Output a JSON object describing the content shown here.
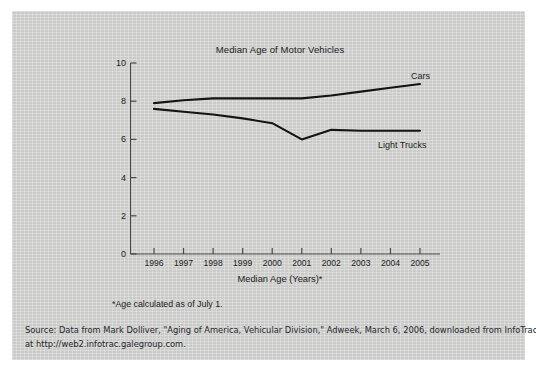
{
  "figure": {
    "background_color": "#d3d3d1",
    "title": "Median Age of Motor Vehicles",
    "xaxis_title": "Median Age (Years)*",
    "footnote": "*Age calculated as of July 1.",
    "source_line_1": "Source: Data from Mark Dolliver, \"Aging of America, Vehicular Division,\" Adweek, March 6, 2006, downloaded from InfoTrac",
    "source_line_2": "at http://web2.infotrac.galegroup.com."
  },
  "chart_data": {
    "type": "line",
    "title": "Median Age of Motor Vehicles",
    "xlabel": "Median Age (Years)*",
    "ylabel": "",
    "categories": [
      "1996",
      "1997",
      "1998",
      "1999",
      "2000",
      "2001",
      "2002",
      "2003",
      "2004",
      "2005"
    ],
    "x": [
      1996,
      1997,
      1998,
      1999,
      2000,
      2001,
      2002,
      2003,
      2004,
      2005
    ],
    "xlim": [
      1995.6,
      2005.4
    ],
    "ylim": [
      0,
      10
    ],
    "yticks": [
      0,
      2,
      4,
      6,
      8,
      10
    ],
    "grid": false,
    "legend_position": "inline-right",
    "line_color": "#141414",
    "series": [
      {
        "name": "Cars",
        "values": [
          7.9,
          8.05,
          8.15,
          8.15,
          8.15,
          8.15,
          8.3,
          8.5,
          8.7,
          8.9
        ]
      },
      {
        "name": "Light Trucks",
        "values": [
          7.6,
          7.45,
          7.3,
          7.1,
          6.85,
          6.0,
          6.5,
          6.45,
          6.45,
          6.45
        ]
      }
    ]
  }
}
